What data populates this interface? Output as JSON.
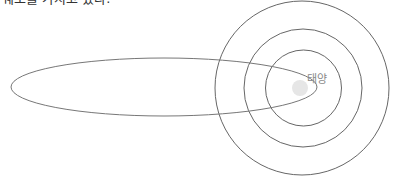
{
  "caption": {
    "text": "궤도를 가지고 있다."
  },
  "diagram": {
    "sun_label": "태양",
    "colors": {
      "orbit_stroke": "#555555",
      "ellipse_stroke": "#777777",
      "sun_fill": "#e4e4e4",
      "label": "#888888"
    },
    "circular_orbits": [
      {
        "name": "inner",
        "cx": 303,
        "cy": 88,
        "r": 38
      },
      {
        "name": "middle",
        "cx": 303,
        "cy": 88,
        "r": 59
      },
      {
        "name": "outer",
        "cx": 302,
        "cy": 88,
        "r": 88
      }
    ],
    "elliptical_orbit": {
      "cx": 164,
      "cy": 87,
      "rx": 153,
      "ry": 29
    },
    "sun": {
      "cx": 300,
      "cy": 88,
      "r": 8
    }
  }
}
